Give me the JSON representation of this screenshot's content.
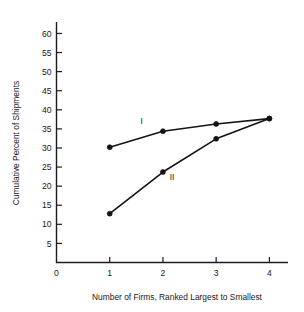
{
  "chart_data": {
    "type": "line",
    "title": "",
    "xlabel": "Number of Firms, Ranked Largest to Smallest",
    "ylabel": "Cumulative Percent of Shipments",
    "x": [
      1,
      2,
      3,
      4
    ],
    "xlim": [
      0,
      4.35
    ],
    "ylim": [
      0,
      63
    ],
    "grid": false,
    "legend_position": "inline-annotation",
    "xticks": [
      "0",
      "1",
      "2",
      "3",
      "4"
    ],
    "xtick_values": [
      0,
      1,
      2,
      3,
      4
    ],
    "yticks": [
      "5",
      "10",
      "15",
      "20",
      "25",
      "30",
      "35",
      "40",
      "45",
      "50",
      "55",
      "60"
    ],
    "ytick_values": [
      5,
      10,
      15,
      20,
      25,
      30,
      35,
      40,
      45,
      50,
      55,
      60
    ],
    "series": [
      {
        "name": "I",
        "values": [
          30.2,
          34.4,
          36.3,
          37.7
        ],
        "label": "I",
        "label_x": 1.6,
        "label_y": 36.4
      },
      {
        "name": "II",
        "values": [
          12.8,
          23.7,
          32.4,
          37.7
        ],
        "label": "II",
        "label_x": 2.17,
        "label_y": 21.6
      }
    ]
  },
  "colors": {
    "line": "#141414",
    "axis": "#1d1d1d",
    "text": "#1a1a1a",
    "background": "#ffffff"
  }
}
